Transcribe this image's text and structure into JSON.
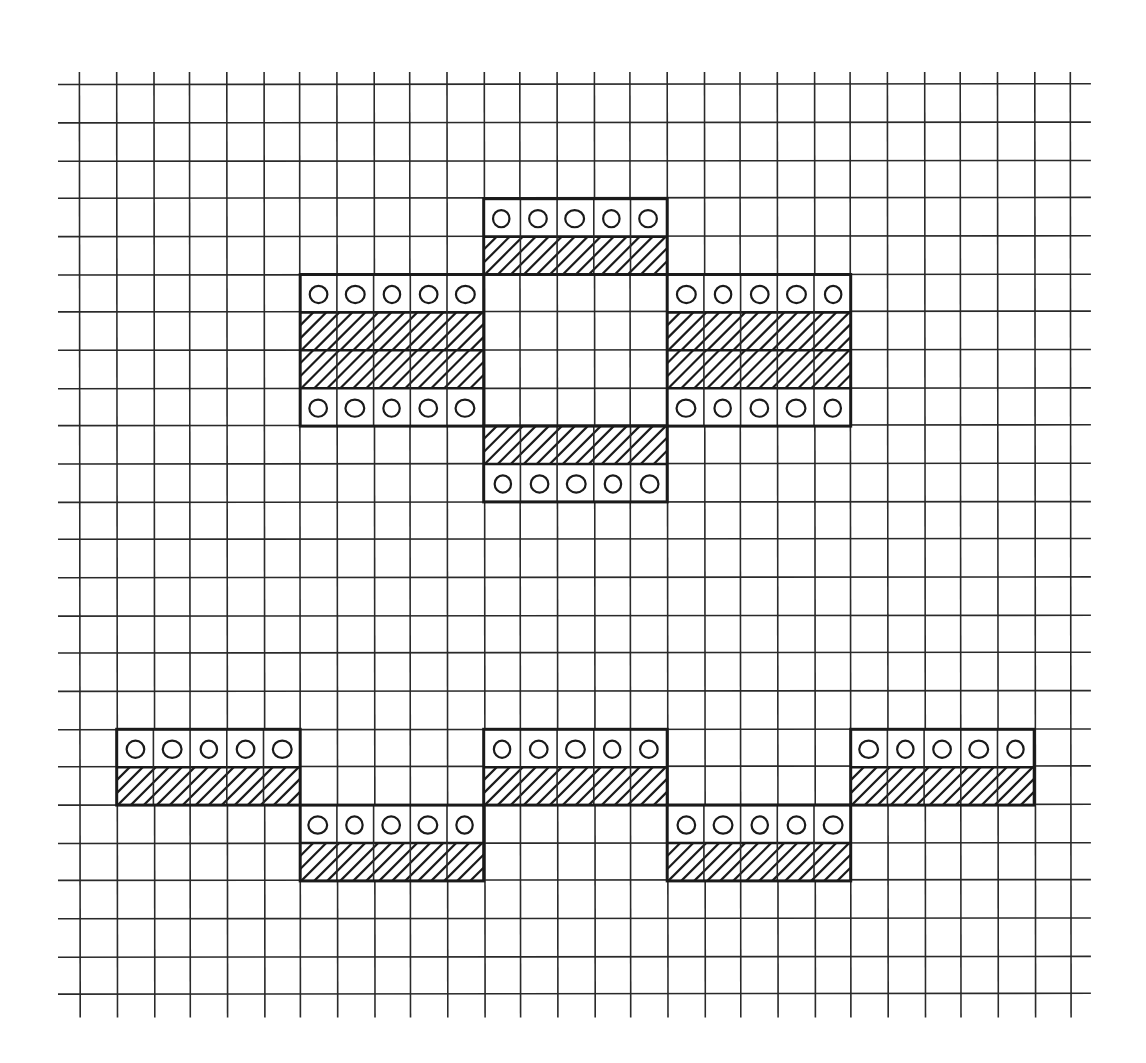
{
  "colors": {
    "background": "#ffffff",
    "ink": "#1a1a1a",
    "grid": "#2a2a2a"
  },
  "grid": {
    "origin_x": 80,
    "origin_y": 85,
    "cell_w": 36.7,
    "cell_h": 37.9,
    "columns": 27,
    "rows": 24,
    "h_line_extend_left": 22,
    "h_line_extend_right": 20,
    "v_line_extend_top": 13,
    "v_line_extend_bottom": 23
  },
  "legend_cells": {
    "circle": "dot-cell",
    "hatch": "hatched-cell"
  },
  "blocks": [
    {
      "name": "top-center-block",
      "col": 11,
      "row": 3,
      "width": 5,
      "pattern": [
        "circle",
        "hatch"
      ]
    },
    {
      "name": "mid-left-block",
      "col": 6,
      "row": 5,
      "width": 5,
      "pattern": [
        "circle",
        "hatch",
        "hatch",
        "circle"
      ]
    },
    {
      "name": "mid-right-block",
      "col": 16,
      "row": 5,
      "width": 5,
      "pattern": [
        "circle",
        "hatch",
        "hatch",
        "circle"
      ]
    },
    {
      "name": "lower-center-block",
      "col": 11,
      "row": 9,
      "width": 5,
      "pattern": [
        "hatch",
        "circle"
      ]
    },
    {
      "name": "bottom-block-1",
      "col": 1,
      "row": 17,
      "width": 5,
      "pattern": [
        "circle",
        "hatch"
      ]
    },
    {
      "name": "bottom-block-2",
      "col": 6,
      "row": 19,
      "width": 5,
      "pattern": [
        "circle",
        "hatch"
      ]
    },
    {
      "name": "bottom-block-3",
      "col": 11,
      "row": 17,
      "width": 5,
      "pattern": [
        "circle",
        "hatch"
      ]
    },
    {
      "name": "bottom-block-4",
      "col": 16,
      "row": 19,
      "width": 5,
      "pattern": [
        "circle",
        "hatch"
      ]
    },
    {
      "name": "bottom-block-5",
      "col": 21,
      "row": 17,
      "width": 5,
      "pattern": [
        "circle",
        "hatch"
      ]
    }
  ]
}
